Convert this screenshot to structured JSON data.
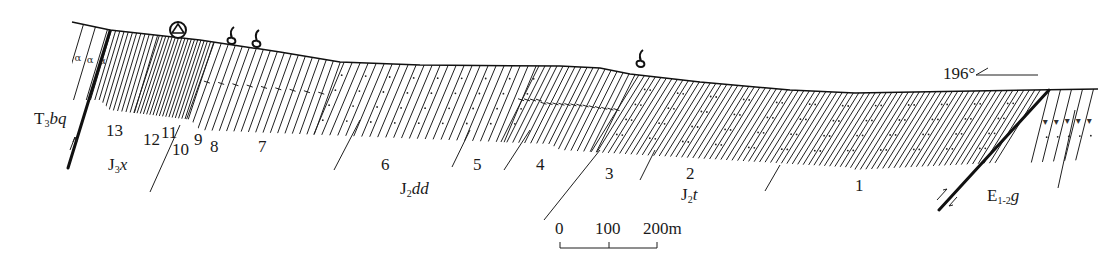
{
  "figure": {
    "type": "geological-cross-section",
    "orientation_label": "196°"
  },
  "formations": [
    {
      "id": "T3bq",
      "label_main": "T",
      "label_sub": "3",
      "label_rest": "bq"
    },
    {
      "id": "J3x",
      "label_main": "J",
      "label_sub": "3",
      "label_rest": "x"
    },
    {
      "id": "J2dd",
      "label_main": "J",
      "label_sub": "2",
      "label_rest": "dd"
    },
    {
      "id": "J2t",
      "label_main": "J",
      "label_sub": "2",
      "label_rest": "t"
    },
    {
      "id": "E1-2g",
      "label_main": "E",
      "label_sub": "1-2",
      "label_rest": "g"
    }
  ],
  "layers": [
    "13",
    "12",
    "11",
    "10",
    "9",
    "8",
    "7",
    "6",
    "5",
    "4",
    "3",
    "2",
    "1"
  ],
  "symbols": {
    "sampling_point": "circle-triangle-icon",
    "fossils": [
      "fossil-icon",
      "fossil-icon",
      "fossil-icon"
    ]
  },
  "scale_bar": {
    "ticks": [
      "0",
      "100",
      "200m"
    ],
    "unit": "m",
    "max_value": 200
  }
}
